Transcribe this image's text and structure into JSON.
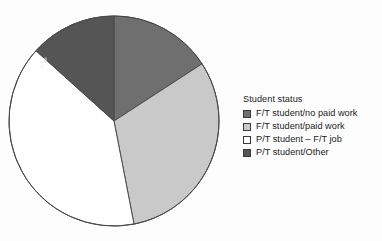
{
  "figure": {
    "background_color": "#fdfdfd"
  },
  "legend": {
    "title": "Student status",
    "position": "right",
    "items": [
      {
        "label": "F/T student/no paid work",
        "color": "#6f6f6f",
        "swatch_name": "legend-swatch-ft-no-paid-work"
      },
      {
        "label": "F/T student/paid work",
        "color": "#c9c9c9",
        "swatch_name": "legend-swatch-ft-paid-work"
      },
      {
        "label": "P/T student – F/T job",
        "color": "#ffffff",
        "swatch_name": "legend-swatch-pt-ft-job"
      },
      {
        "label": "P/T student/Other",
        "color": "#555555",
        "swatch_name": "legend-swatch-pt-other"
      }
    ]
  },
  "chart_data": {
    "type": "pie",
    "title": "",
    "subtitle": "",
    "xlabel": "",
    "ylabel": "",
    "legend_title": "Student status",
    "legend_position": "right",
    "grid": false,
    "start_angle_deg": 0,
    "direction": "clockwise",
    "center": {
      "x": 114,
      "y": 121
    },
    "radius": 105,
    "labels": [
      "F/T student/no paid work",
      "F/T student/paid work",
      "P/T student – F/T job",
      "P/T student/Other"
    ],
    "values": [
      15.8,
      31.1,
      39.8,
      13.3
    ],
    "units": "percent",
    "colors": [
      "#6f6f6f",
      "#c9c9c9",
      "#ffffff",
      "#555555"
    ],
    "slice_angles_deg": [
      {
        "label": "F/T student/no paid work",
        "start": 0,
        "end": 57,
        "sweep": 57
      },
      {
        "label": "F/T student/paid work",
        "start": 57,
        "end": 169,
        "sweep": 112
      },
      {
        "label": "P/T student – F/T job",
        "start": 169,
        "end": 312,
        "sweep": 143
      },
      {
        "label": "P/T student/Other",
        "start": 312,
        "end": 360,
        "sweep": 48
      }
    ],
    "edge_color": "#4a4a4a",
    "edge_width": 1
  }
}
